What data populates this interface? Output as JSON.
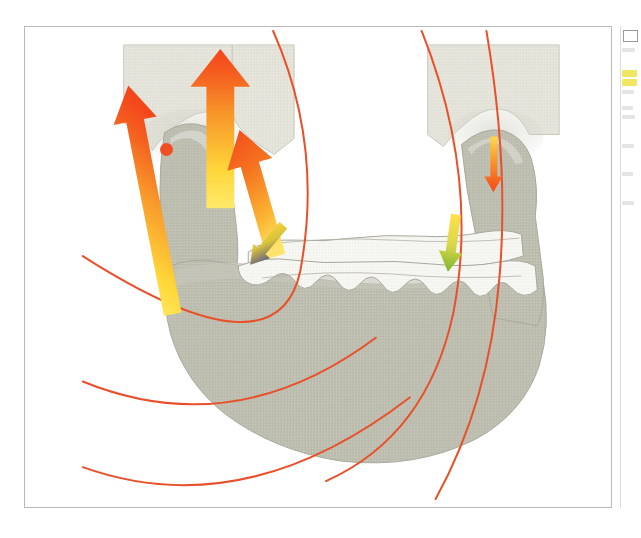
{
  "figure": {
    "title": "Mandible force-vector and stress-trajectory diagram",
    "caption": "",
    "frame": {
      "border_color": "#b9b9b9",
      "background": "#ffffff"
    },
    "colors": {
      "bone_mandible": "#bdbdb0",
      "bone_outline": "#9a9a8e",
      "bone_upper_block": "#e4e3da",
      "teeth_fill": "#f6f6f2",
      "teeth_outline": "#a8a89c",
      "condyle_gray": "#b4b4a8",
      "arrow_head_orange": "#f4541f",
      "arrow_mid_orange": "#f58220",
      "arrow_tail_yellow": "#ffd93a",
      "trajectory_red": "#e8502a",
      "marker_dot_red": "#f04e23",
      "arrow_blue": "#3b3c9e",
      "arrow_green": "#8cc63f",
      "background_white": "#ffffff"
    },
    "elements": {
      "maxilla_block_left_label": "left upper block",
      "maxilla_block_right_label": "right upper block",
      "mandible_label": "mandible body",
      "left_condyle_label": "left condyle / ramus",
      "right_condyle_label": "right condyle / ramus",
      "teeth_label": "tooth row",
      "rotation_center_label": "rotation centre marker"
    },
    "arrows": [
      {
        "name": "muscle-force-arrow-1",
        "direction": "up-left",
        "tail_color": "#ffd93a",
        "head_color": "#f4541f",
        "start": [
          157,
          316
        ],
        "end": [
          113,
          91
        ],
        "width": 18
      },
      {
        "name": "muscle-force-arrow-2",
        "direction": "up",
        "tail_color": "#ffd93a",
        "head_color": "#f4541f",
        "start": [
          196,
          207
        ],
        "end": [
          198,
          62
        ],
        "width": 24
      },
      {
        "name": "muscle-force-arrow-3",
        "direction": "up-left",
        "tail_color": "#ffd93a",
        "head_color": "#f4541f",
        "start": [
          254,
          250
        ],
        "end": [
          240,
          144
        ],
        "width": 19
      },
      {
        "name": "condyle-load-arrow",
        "direction": "down",
        "tail_color": "#ffd93a",
        "head_color": "#f4541f",
        "start": [
          498,
          135
        ],
        "end": [
          499,
          188
        ],
        "width": 7
      },
      {
        "name": "bite-force-arrow-left",
        "direction": "down-left",
        "tail_color": "#ffd93a",
        "head_color": "#3b3c9e",
        "start": [
          284,
          231
        ],
        "end": [
          259,
          253
        ],
        "width": 9
      },
      {
        "name": "bite-force-arrow-right",
        "direction": "down",
        "tail_color": "#ffd93a",
        "head_color": "#8cc63f",
        "start": [
          448,
          226
        ],
        "end": [
          452,
          264
        ],
        "width": 9
      }
    ],
    "trajectories": [
      {
        "name": "stress-trajectory-1",
        "color": "#e8502a",
        "note": "long arc from top-centre sweeping down to lower-left"
      },
      {
        "name": "stress-trajectory-2",
        "color": "#e8502a",
        "note": "arc from top-right descending through mandible to bottom-centre"
      },
      {
        "name": "stress-trajectory-3",
        "color": "#e8502a",
        "note": "steep arc on right side through condyle"
      },
      {
        "name": "stress-trajectory-4",
        "color": "#e8502a",
        "note": "shallow arc across lower-left region"
      },
      {
        "name": "stress-trajectory-5",
        "color": "#e8502a",
        "note": "lowest shallow arc near bottom-left"
      }
    ]
  },
  "margin": {
    "note": "partially cropped body text at right page edge",
    "highlighted_line_color": "#efe55c",
    "lines": [
      {
        "top": 22,
        "width": 13,
        "kind": "small"
      },
      {
        "top": 44,
        "width": 15,
        "kind": "highlight"
      },
      {
        "top": 53,
        "width": 15,
        "kind": "highlight"
      },
      {
        "top": 64,
        "width": 12,
        "kind": "small"
      },
      {
        "top": 80,
        "width": 11,
        "kind": "small"
      },
      {
        "top": 89,
        "width": 13,
        "kind": "small"
      },
      {
        "top": 118,
        "width": 12,
        "kind": "small"
      },
      {
        "top": 146,
        "width": 11,
        "kind": "small"
      },
      {
        "top": 175,
        "width": 12,
        "kind": "small"
      }
    ]
  }
}
